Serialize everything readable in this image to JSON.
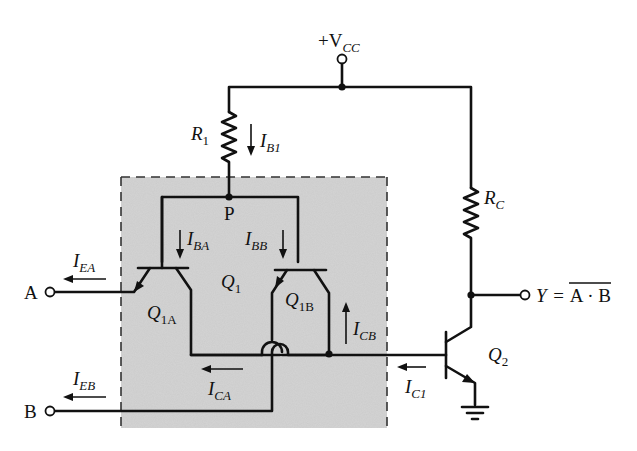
{
  "supply": {
    "label": "+V",
    "sub": "CC"
  },
  "node_p": "P",
  "resistors": {
    "r1": {
      "label": "R",
      "sub": "1"
    },
    "rc": {
      "label": "R",
      "sub": "C"
    }
  },
  "transistors": {
    "q1": {
      "label": "Q",
      "sub": "1"
    },
    "q1a": {
      "label": "Q",
      "sub": "1A"
    },
    "q1b": {
      "label": "Q",
      "sub": "1B"
    },
    "q2": {
      "label": "Q",
      "sub": "2"
    }
  },
  "inputs": {
    "a": "A",
    "b": "B"
  },
  "output": {
    "y_label": "Y",
    "equals": "=",
    "expression": "A · B",
    "overline": true
  },
  "currents": {
    "ib1": {
      "label": "I",
      "sub": "B1",
      "direction": "down"
    },
    "iba": {
      "label": "I",
      "sub": "BA",
      "direction": "down"
    },
    "ibb": {
      "label": "I",
      "sub": "BB",
      "direction": "down"
    },
    "iea": {
      "label": "I",
      "sub": "EA",
      "direction": "left"
    },
    "ieb": {
      "label": "I",
      "sub": "EB",
      "direction": "left"
    },
    "ica": {
      "label": "I",
      "sub": "CA",
      "direction": "left"
    },
    "icb": {
      "label": "I",
      "sub": "CB",
      "direction": "up"
    },
    "ic1": {
      "label": "I",
      "sub": "C1",
      "direction": "left"
    }
  },
  "colors": {
    "ink": "#111111",
    "shaded_region": "#d4d4d4",
    "background": "#ffffff"
  }
}
